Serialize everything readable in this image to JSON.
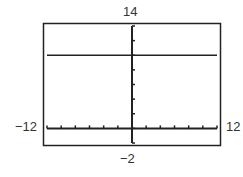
{
  "chart_data": {
    "type": "line",
    "title": "",
    "xlabel": "",
    "ylabel": "",
    "xlim": [
      -12,
      12
    ],
    "ylim": [
      -2,
      14
    ],
    "x_tick_step": 2,
    "y_tick_step": 2,
    "grid": false,
    "window_labels": {
      "ymax": "14",
      "ymin": "−2",
      "xmin": "−12",
      "xmax": "12"
    },
    "series": [
      {
        "name": "y = 10",
        "x": [
          -12,
          12
        ],
        "values": [
          10,
          10
        ]
      }
    ]
  },
  "colors": {
    "axis": "#222222",
    "frame": "#222222",
    "line": "#222222"
  }
}
